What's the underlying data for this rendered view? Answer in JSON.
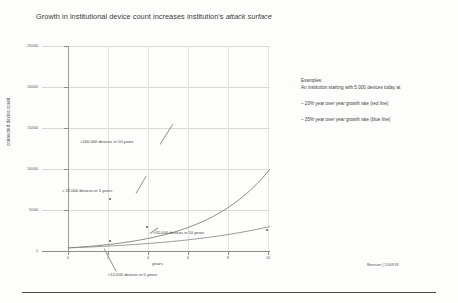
{
  "slide": {
    "title_main": "Growth in institutional device count increases institution’s ",
    "title_italic": "attack surface",
    "footer": "Benson | 100918"
  },
  "examples": {
    "heading": "Examples:",
    "subheading": "An institution starting with 5,000 devices today at",
    "bullets": [
      "– 20% year over year growth rate (red line)",
      "– 35% year over year growth rate (blue line)"
    ]
  },
  "annotations": [
    {
      "id": "100k",
      "text": ">100,000 devices in 10 years"
    },
    {
      "id": "22k",
      "text": "> 22,000 devices in 5 years"
    },
    {
      "id": "31k",
      "text": ">31,000 devices in 10 years"
    },
    {
      "id": "12k",
      "text": ">12,000 devices in 5 years"
    }
  ],
  "chart_data": {
    "type": "line",
    "title": "Growth in institutional device count increases institution’s attack surface",
    "xlabel": "years",
    "ylabel": "connected device count",
    "x": [
      0,
      1,
      2,
      3,
      4,
      5,
      6,
      7,
      8,
      9,
      10
    ],
    "xlim": [
      0,
      10
    ],
    "ylim": [
      0,
      250000
    ],
    "xticks": [
      0,
      2,
      4,
      6,
      8,
      10
    ],
    "xtick_labels": [
      "0",
      "2",
      "4",
      "6",
      "8",
      "10"
    ],
    "yticks": [
      0,
      50000,
      100000,
      150000,
      200000,
      250000
    ],
    "ytick_labels": [
      "0",
      "50000",
      "100000",
      "150000",
      "200000",
      "250000"
    ],
    "grid": true,
    "legend": "none",
    "series": [
      {
        "name": "35% year over year growth rate (blue line)",
        "color": "#7b7b7b",
        "growth_rate_pct": 35,
        "start_value": 5000,
        "values": [
          5000,
          6750,
          9113,
          12302,
          16608,
          22421,
          30268,
          40862,
          55164,
          74472,
          100537
        ]
      },
      {
        "name": "20% year over year growth rate (red line)",
        "color": "#8a8a8a",
        "growth_rate_pct": 20,
        "start_value": 5000,
        "values": [
          5000,
          6000,
          7200,
          8640,
          10368,
          12442,
          14930,
          17916,
          21499,
          25799,
          30959
        ]
      }
    ],
    "callouts": [
      {
        "label": ">100,000 devices in 10 years",
        "x": 10,
        "y": 100537,
        "series": "35%"
      },
      {
        "label": "> 22,000 devices in 5 years",
        "x": 5,
        "y": 22421,
        "series": "35%"
      },
      {
        "label": ">31,000 devices in 10 years",
        "x": 10,
        "y": 30959,
        "series": "20%"
      },
      {
        "label": ">12,000 devices in 5 years",
        "x": 5,
        "y": 12442,
        "series": "20%"
      }
    ]
  }
}
